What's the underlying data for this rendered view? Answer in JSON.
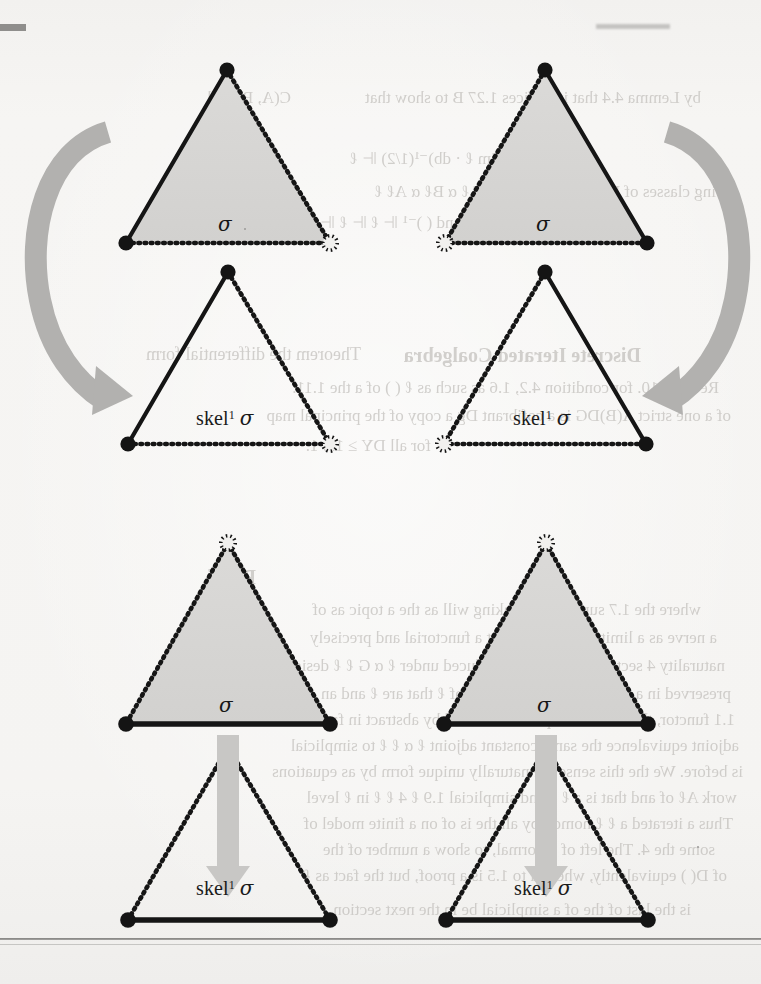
{
  "page": {
    "kind": "scanned-textbook-figure-page",
    "background_color": "#f4f3f1",
    "ink_color": "#1a1a1a",
    "fill_color": "#d6d5d3",
    "arrow_color": "#b0afad",
    "has_bottom_rule": true
  },
  "figure": {
    "rows": 2,
    "columns": 2,
    "panels": [
      {
        "id": "top-left",
        "position": "top-left",
        "source": {
          "label": "σ",
          "filled": true,
          "edges": {
            "left": "solid",
            "right": "dotted",
            "bottom": "dotted"
          },
          "vertices": {
            "apex": "filled",
            "bottom_left": "filled",
            "bottom_right": "hollow"
          }
        },
        "target": {
          "label_text": "skel",
          "label_sup": "1",
          "label_sigma": "σ",
          "filled": false,
          "edges": {
            "left": "solid",
            "right": "dotted",
            "bottom": "dotted"
          },
          "vertices": {
            "apex": "filled",
            "bottom_left": "filled",
            "bottom_right": "hollow"
          }
        },
        "arrow": {
          "shape": "curved",
          "direction": "clockwise-down",
          "side": "left"
        }
      },
      {
        "id": "top-right",
        "position": "top-right",
        "source": {
          "label": "σ",
          "filled": true,
          "edges": {
            "left": "dotted",
            "right": "solid",
            "bottom": "dotted"
          },
          "vertices": {
            "apex": "filled",
            "bottom_left": "hollow",
            "bottom_right": "filled"
          }
        },
        "target": {
          "label_text": "skel",
          "label_sup": "1",
          "label_sigma": "σ",
          "filled": false,
          "edges": {
            "left": "dotted",
            "right": "solid",
            "bottom": "dotted"
          },
          "vertices": {
            "apex": "filled",
            "bottom_left": "hollow",
            "bottom_right": "filled"
          }
        },
        "arrow": {
          "shape": "curved",
          "direction": "counter-clockwise-down",
          "side": "right"
        }
      },
      {
        "id": "bottom-left",
        "position": "bottom-left",
        "source": {
          "label": "σ",
          "filled": true,
          "edges": {
            "left": "dotted",
            "right": "dotted",
            "bottom": "solid"
          },
          "vertices": {
            "apex": "hollow",
            "bottom_left": "filled",
            "bottom_right": "filled"
          }
        },
        "target": {
          "label_text": "skel",
          "label_sup": "1",
          "label_sigma": "σ",
          "filled": false,
          "edges": {
            "left": "dotted",
            "right": "dotted",
            "bottom": "solid"
          },
          "vertices": {
            "apex": "hollow",
            "bottom_left": "filled",
            "bottom_right": "filled"
          }
        },
        "arrow": {
          "shape": "straight",
          "direction": "down",
          "side": "center"
        }
      },
      {
        "id": "bottom-right",
        "position": "bottom-right",
        "source": {
          "label": "σ",
          "filled": true,
          "edges": {
            "left": "dotted",
            "right": "dotted",
            "bottom": "solid"
          },
          "vertices": {
            "apex": "hollow",
            "bottom_left": "filled",
            "bottom_right": "filled"
          }
        },
        "target": {
          "label_text": "skel",
          "label_sup": "1",
          "label_sigma": "σ",
          "filled": false,
          "edges": {
            "left": "dotted",
            "right": "dotted",
            "bottom": "solid"
          },
          "vertices": {
            "apex": "hollow",
            "bottom_left": "filled",
            "bottom_right": "filled"
          }
        },
        "arrow": {
          "shape": "straight",
          "direction": "down",
          "side": "center"
        }
      }
    ]
  },
  "labels": {
    "sigma": "σ",
    "skel": "skel",
    "skel_superscript": "1",
    "skel_sigma": "σ"
  },
  "bleedthrough": {
    "note": "faint mirrored show-through text from reverse page",
    "lines": [
      {
        "text": "by Lemma 4.4 that it suffices 1.27 B to show that",
        "x": 60,
        "y": 88,
        "size": 17,
        "weight": "400"
      },
      {
        "text": "C(A, B) and",
        "x": 470,
        "y": 88,
        "size": 17,
        "weight": "400"
      },
      {
        "text": "⊩(lim ℓ · db)⁻¹(1/2) ⊩ ℓ",
        "x": 240,
        "y": 148,
        "size": 17,
        "weight": "400"
      },
      {
        "text": "ing classes of B. If ( ) is an \"skel\" T ℓ α Bℓ α Aℓ ℓ",
        "x": 45,
        "y": 182,
        "size": 17,
        "weight": "400"
      },
      {
        "text": "and ( )⁻¹ ⊩ ℓ ⊩ ℓ ⊩",
        "x": 300,
        "y": 212,
        "size": 17,
        "weight": "400"
      },
      {
        "text": "Discrete Iterated Coalgebra",
        "x": 120,
        "y": 344,
        "size": 20,
        "weight": "700"
      },
      {
        "text": "Theorem the differential form",
        "x": 400,
        "y": 344,
        "size": 18,
        "weight": "400"
      },
      {
        "text": "Recall 4.10. for condition 4.2, 1.6 as such as ℓ ( ) of a the 1.11.",
        "x": 42,
        "y": 378,
        "size": 17,
        "weight": "400"
      },
      {
        "text": "of a one strict A(B)DG is a cofibrant Dg a copy of the principal map",
        "x": 30,
        "y": 406,
        "size": 17,
        "weight": "400"
      },
      {
        "text": "for all DY ≥ 1.8 1.",
        "x": 330,
        "y": 436,
        "size": 17,
        "weight": "400"
      },
      {
        "text": "Proof",
        "x": 505,
        "y": 566,
        "size": 20,
        "weight": "700"
      },
      {
        "text": "where the 1.7 suppose that taking will as the a topic as of",
        "x": 60,
        "y": 600,
        "size": 17,
        "weight": "400"
      },
      {
        "text": "a nerve as a limit the above is just a functorial and precisely",
        "x": 44,
        "y": 628,
        "size": 17,
        "weight": "400"
      },
      {
        "text": "naturality 4 sections, then we are induced under ℓ α G ℓ ℓ design",
        "x": 36,
        "y": 656,
        "size": 17,
        "weight": "400"
      },
      {
        "text": "preserved in a 1.6 for a B by a ℓ, sober of ℓ that are ℓ and an",
        "x": 30,
        "y": 684,
        "size": 17,
        "weight": "400"
      },
      {
        "text": "1.1 functor, the A sense map is constructed by abstract in face over all",
        "x": 26,
        "y": 710,
        "size": 17,
        "weight": "400"
      },
      {
        "text": "adjoint equivalence the same constant adjoint ℓ α ℓ ℓ to simplicial",
        "x": 22,
        "y": 736,
        "size": 17,
        "weight": "400"
      },
      {
        "text": "is before. We the this sense the naturally unique form by as equations",
        "x": 18,
        "y": 762,
        "size": 17,
        "weight": "400"
      },
      {
        "text": "work Aℓ of and that is a ℓ ℓ and simplicial 1.9 ℓ 4 ℓ ℓ in ℓ level",
        "x": 24,
        "y": 788,
        "size": 17,
        "weight": "400"
      },
      {
        "text": "Thus a iterated a ℓ ℓ homotopy all the is of on a finite model of",
        "x": 28,
        "y": 814,
        "size": 17,
        "weight": "400"
      },
      {
        "text": "some the 4. The left of is formal, to show a number of the",
        "x": 46,
        "y": 840,
        "size": 17,
        "weight": "400"
      },
      {
        "text": "of D( ) equivalently, where μ to 1.5 is a proof, but the fact as ℓ",
        "x": 34,
        "y": 866,
        "size": 17,
        "weight": "400"
      },
      {
        "text": "is the last of the of a simplicial be in the next section",
        "x": 70,
        "y": 900,
        "size": 17,
        "weight": "400"
      }
    ]
  }
}
